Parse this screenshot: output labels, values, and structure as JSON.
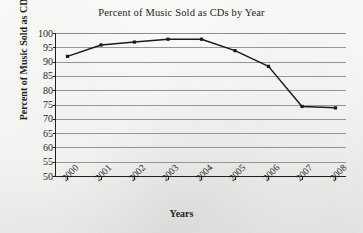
{
  "chart_data": {
    "type": "line",
    "title": "Percent of Music Sold as CDs by Year",
    "xlabel": "Years",
    "ylabel": "Percent of Music Sold as CDs",
    "categories": [
      "2000",
      "2001",
      "2002",
      "2003",
      "2004",
      "2005",
      "2006",
      "2007",
      "2008"
    ],
    "values": [
      92,
      96,
      97,
      98,
      98,
      94,
      88.5,
      74.5,
      74
    ],
    "series": [
      {
        "name": "Percent of Music Sold as CDs",
        "values": [
          92,
          96,
          97,
          98,
          98,
          94,
          88.5,
          74.5,
          74
        ]
      }
    ],
    "ylim": [
      50,
      100
    ],
    "ytick_step": 5,
    "ytick_labels": [
      "100",
      "95",
      "90",
      "85",
      "80",
      "75",
      "70",
      "65",
      "60",
      "55",
      "50"
    ],
    "grid": true,
    "grid_axis": "y",
    "legend": false,
    "marker": "square",
    "line_color": "#1a1a1a",
    "marker_color": "#1a1a1a",
    "grid_color": "#8c8c8c",
    "axis_color": "#1f1f1f",
    "background_color": "#eeeeec",
    "xtick_rotation": -45
  }
}
